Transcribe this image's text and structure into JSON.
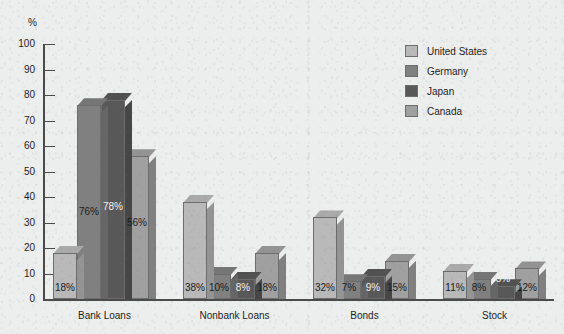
{
  "chart_data": {
    "type": "bar",
    "title": "",
    "xlabel": "",
    "ylabel": "%",
    "ylim": [
      0,
      100
    ],
    "ytick_step": 10,
    "yticks": [
      100,
      90,
      80,
      70,
      60,
      50,
      40,
      30,
      20,
      10,
      0
    ],
    "grid": false,
    "legend_position": "top-right",
    "categories": [
      "Bank Loans",
      "Nonbank Loans",
      "Bonds",
      "Stock"
    ],
    "series": [
      {
        "name": "United States",
        "color": "#b9b9b9",
        "values": [
          18,
          38,
          32,
          11
        ]
      },
      {
        "name": "Germany",
        "color": "#808080",
        "values": [
          76,
          10,
          7,
          8
        ]
      },
      {
        "name": "Japan",
        "color": "#585858",
        "values": [
          78,
          8,
          9,
          5
        ]
      },
      {
        "name": "Canada",
        "color": "#a0a0a0",
        "values": [
          56,
          18,
          15,
          12
        ]
      }
    ],
    "value_labels": [
      [
        "18%",
        "76%",
        "78%",
        "56%"
      ],
      [
        "38%",
        "10%",
        "8%",
        "18%"
      ],
      [
        "32%",
        "7%",
        "9%",
        "15%"
      ],
      [
        "11%",
        "8%",
        "5%",
        "12%"
      ]
    ]
  },
  "axis": {
    "unit_label": "%",
    "tick_labels": [
      "100",
      "90",
      "80",
      "70",
      "60",
      "50",
      "40",
      "30",
      "20",
      "10",
      "0"
    ]
  },
  "legend": {
    "items": [
      {
        "label": "United States"
      },
      {
        "label": "Germany"
      },
      {
        "label": "Japan"
      },
      {
        "label": "Canada"
      }
    ]
  }
}
